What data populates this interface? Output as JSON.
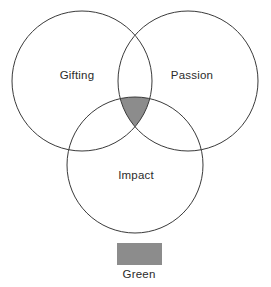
{
  "diagram": {
    "type": "venn",
    "title": "",
    "background_color": "#ffffff",
    "stroke_color": "#3a3a3a",
    "stroke_width": 1,
    "label_color": "#2b2b2b",
    "circles": [
      {
        "id": "gifting",
        "label": "Gifting",
        "cx": 82,
        "cy": 81,
        "r": 70,
        "fill": "none",
        "label_x": 77,
        "label_y": 76
      },
      {
        "id": "passion",
        "label": "Passion",
        "cx": 188,
        "cy": 81,
        "r": 70,
        "fill": "none",
        "label_x": 192,
        "label_y": 76
      },
      {
        "id": "impact",
        "label": "Impact",
        "cx": 135,
        "cy": 165,
        "r": 68,
        "fill": "none",
        "label_x": 136,
        "label_y": 176
      }
    ],
    "shaded_region": {
      "id": "center-intersection",
      "members": [
        "gifting",
        "passion",
        "impact"
      ],
      "fill": "#8c8c8c"
    }
  },
  "legend": {
    "items": [
      {
        "swatch_color": "#8c8c8c",
        "label": "Green",
        "swatch_x": 117,
        "swatch_y": 243,
        "swatch_width": 45,
        "swatch_height": 22,
        "label_x": 139,
        "label_y": 275
      }
    ]
  }
}
